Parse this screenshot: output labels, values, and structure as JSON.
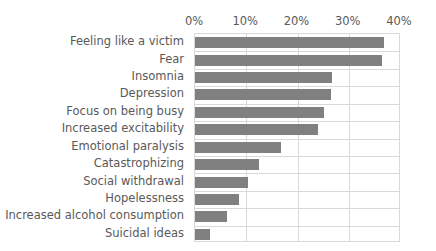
{
  "chart_data": {
    "type": "bar",
    "orientation": "horizontal",
    "title": "",
    "xlabel": "",
    "ylabel": "",
    "xlim": [
      0,
      40
    ],
    "xticks": [
      "0%",
      "10%",
      "20%",
      "30%",
      "40%"
    ],
    "xtick_values": [
      0,
      10,
      20,
      30,
      40
    ],
    "grid": true,
    "legend": "none",
    "bar_color": "#808080",
    "gridline_color": "#d9d9d9",
    "text_color": "#595959",
    "categories": [
      "Feeling like a victim",
      "Fear",
      "Insomnia",
      "Depression",
      "Focus on being busy",
      "Increased excitability",
      "Emotional paralysis",
      "Catastrophizing",
      "Social withdrawal",
      "Hopelessness",
      "Increased alcohol consumption",
      "Suicidal ideas"
    ],
    "values": [
      36.8,
      36.4,
      26.8,
      26.6,
      25.2,
      24.0,
      16.7,
      12.4,
      10.4,
      8.5,
      6.2,
      2.9
    ]
  }
}
